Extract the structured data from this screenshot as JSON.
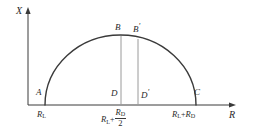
{
  "figure": {
    "type": "semicircle-impedance-diagram",
    "background": "#ffffff",
    "line_color": "#3a3a3a",
    "guide_color": "#9a9a9a",
    "axes": {
      "x_axis_label": "X",
      "r_axis_label": "R",
      "origin_px": [
        28,
        105
      ],
      "x_axis_top_px": [
        28,
        10
      ],
      "r_axis_right_px": [
        236,
        105
      ]
    },
    "arc": {
      "left_point_px": [
        45,
        105
      ],
      "right_point_px": [
        196,
        105
      ],
      "apex_px": [
        120,
        35
      ],
      "radius_px": 75.5,
      "center_px": [
        120.5,
        105
      ],
      "description": "semicircle from A to C"
    },
    "points": [
      {
        "id": "A",
        "label": "A",
        "x_px": 45,
        "y_px": 105,
        "label_x": 36,
        "label_y": 90
      },
      {
        "id": "B",
        "label": "B",
        "x_px": 121,
        "y_px": 36,
        "label_x": 115,
        "label_y": 25
      },
      {
        "id": "Bp",
        "label": "B",
        "prime": "'",
        "x_px": 138,
        "y_px": 39,
        "label_x": 134,
        "label_y": 25
      },
      {
        "id": "D",
        "label": "D",
        "x_px": 121,
        "y_px": 105,
        "label_x": 111,
        "label_y": 91
      },
      {
        "id": "Dp",
        "label": "D",
        "prime": "'",
        "x_px": 138,
        "y_px": 105,
        "label_x": 140,
        "label_y": 91
      },
      {
        "id": "C",
        "label": "C",
        "x_px": 196,
        "y_px": 105,
        "label_x": 196,
        "label_y": 90
      }
    ],
    "guide_lines": [
      {
        "name": "BD",
        "from_px": [
          121,
          36
        ],
        "to_px": [
          121,
          105
        ]
      },
      {
        "name": "BpDp",
        "from_px": [
          138,
          39
        ],
        "to_px": [
          138,
          105
        ]
      }
    ],
    "tick_labels": {
      "left": {
        "main": "R",
        "sub": "L",
        "x_px": 38,
        "y_px": 108
      },
      "middle": {
        "term1_main": "R",
        "term1_sub": "L",
        "operator": "+",
        "numerator_main": "R",
        "numerator_sub": "D",
        "denominator": "2",
        "x_px": 103,
        "y_px": 107
      },
      "right": {
        "term1_main": "R",
        "term1_sub": "L",
        "operator": "+",
        "term2_main": "R",
        "term2_sub": "D",
        "x_px": 173,
        "y_px": 108
      }
    }
  }
}
